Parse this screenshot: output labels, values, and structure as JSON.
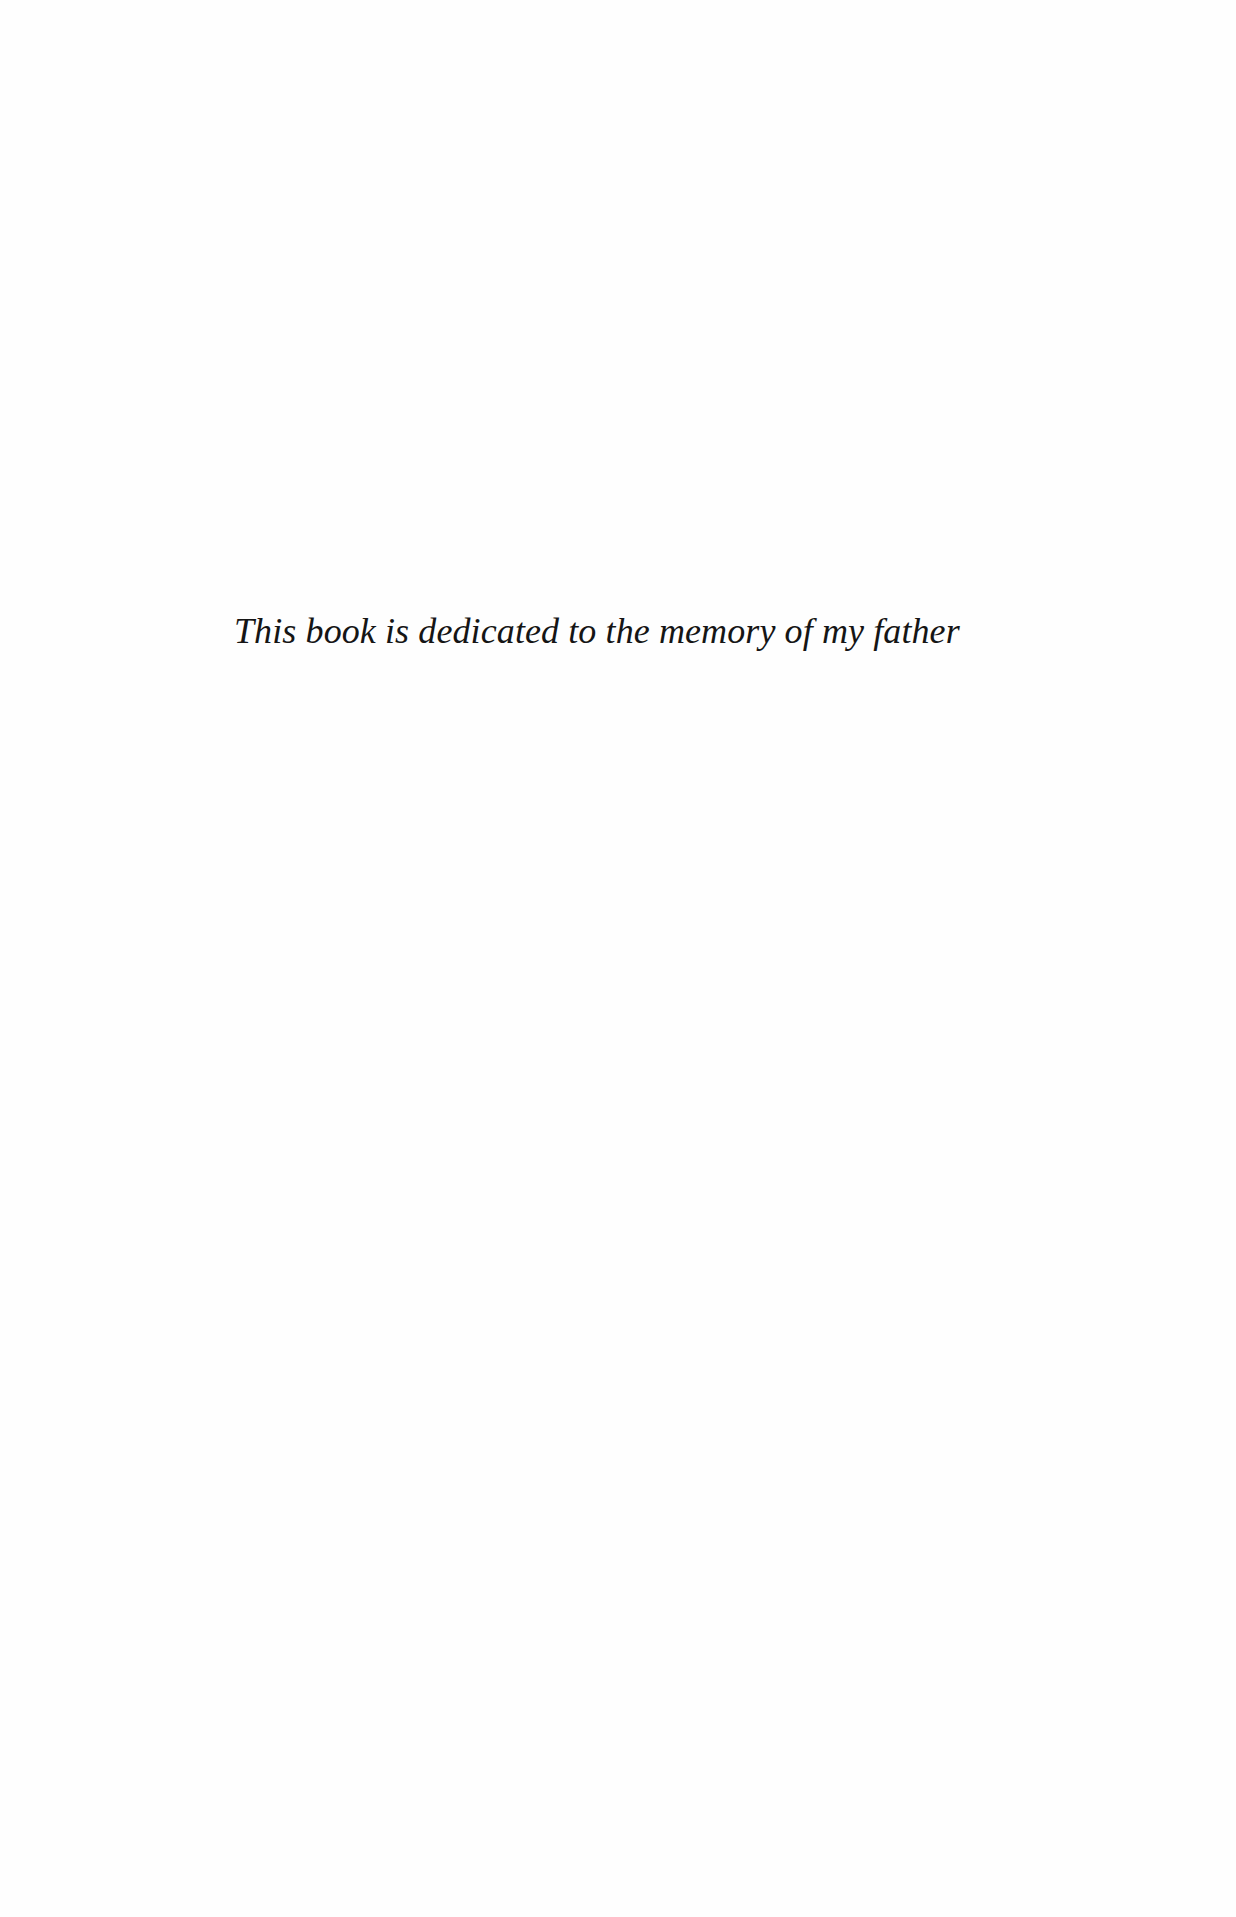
{
  "page": {
    "dedication": {
      "text": "This book is dedicated to the memory of my father"
    }
  }
}
